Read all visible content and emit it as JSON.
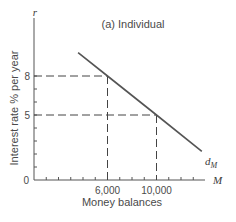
{
  "chart_data": {
    "type": "line",
    "title": "(a) Individual",
    "xlabel": "Money balances",
    "ylabel": "Interest rate % per year",
    "x_axis_symbol": "M",
    "y_axis_symbol": "r",
    "origin_label": "0",
    "xlim": [
      0,
      14000
    ],
    "ylim": [
      0,
      12
    ],
    "x_ticks_labeled": [
      {
        "value": 6000,
        "label": "6,000"
      },
      {
        "value": 10000,
        "label": "10,000"
      }
    ],
    "x_minor_tick_step": 1000,
    "y_ticks_labeled": [
      {
        "value": 8,
        "label": "8"
      },
      {
        "value": 5,
        "label": "5"
      }
    ],
    "y_minor_tick_step": 1,
    "grid": false,
    "series": [
      {
        "name": "d_M",
        "label_main": "d",
        "label_sub": "M",
        "x": [
          3600,
          6000,
          10000,
          13700
        ],
        "y": [
          9.8,
          8,
          5,
          2.2
        ]
      }
    ],
    "reference_points": [
      {
        "x": 6000,
        "y": 8
      },
      {
        "x": 10000,
        "y": 5
      }
    ]
  }
}
